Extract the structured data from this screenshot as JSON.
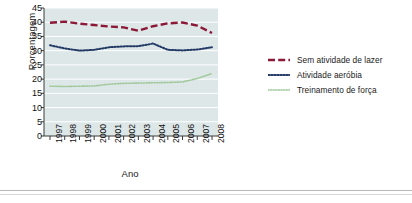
{
  "chart_data": {
    "type": "line",
    "title": "",
    "xlabel": "Ano",
    "ylabel": "Porcentagem",
    "categories": [
      "1997",
      "1998",
      "1999",
      "2000",
      "2001",
      "2002",
      "2003",
      "2004",
      "2005",
      "2006",
      "2007",
      "2008"
    ],
    "x": [
      1997,
      1998,
      1999,
      2000,
      2001,
      2002,
      2003,
      2004,
      2005,
      2006,
      2007,
      2008
    ],
    "ylim": [
      0,
      45
    ],
    "yticks": [
      "0",
      "5",
      "10",
      "15",
      "20",
      "25",
      "30",
      "35",
      "40",
      "45"
    ],
    "ytick_values": [
      0,
      5,
      10,
      15,
      20,
      25,
      30,
      35,
      40,
      45
    ],
    "grid": true,
    "legend_position": "right",
    "series": [
      {
        "name": "Sem atividade de lazer",
        "color": "#8c1838",
        "style": "dashed",
        "values": [
          39.8,
          40.2,
          39.5,
          39.0,
          38.5,
          38.2,
          37.0,
          38.6,
          39.6,
          39.9,
          38.8,
          36.2
        ]
      },
      {
        "name": "Atividade aeróbia",
        "color": "#243a66",
        "style": "dotted",
        "values": [
          31.9,
          30.8,
          30.0,
          30.3,
          31.2,
          31.5,
          31.6,
          32.5,
          30.3,
          30.1,
          30.4,
          31.2
        ]
      },
      {
        "name": "Treinamento de força",
        "color": "#9fc89a",
        "style": "fine-dotted",
        "values": [
          17.5,
          17.4,
          17.5,
          17.6,
          18.2,
          18.5,
          18.6,
          18.7,
          18.8,
          19.0,
          20.2,
          22.0
        ]
      }
    ]
  },
  "axes": {
    "y_title": "Porcentagem",
    "x_title": "Ano"
  },
  "legend": {
    "items": [
      {
        "label": "Sem atividade de lazer"
      },
      {
        "label": "Atividade aeróbia"
      },
      {
        "label": "Treinamento de força"
      }
    ]
  },
  "colors": {
    "plot_background": "#dde7e8",
    "gridline": "#ffffff",
    "axis": "#3b3b3b",
    "series_1": "#8c1838",
    "series_2": "#243a66",
    "series_3": "#9fc89a"
  }
}
